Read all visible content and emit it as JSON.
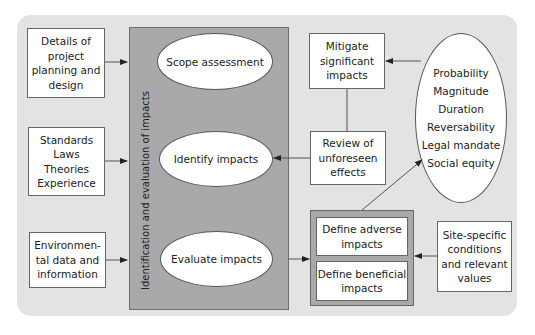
{
  "diagram": {
    "center_panel_label": "Identification and evaluation of impacts",
    "inputs": [
      {
        "id": "project",
        "label": "Details of project planning and design",
        "lines": [
          "Details of",
          "project",
          "planning and",
          "design"
        ]
      },
      {
        "id": "standards",
        "label": "Standards Laws Theories Experience",
        "lines": [
          "Standards",
          "Laws",
          "Theories",
          "Experience"
        ]
      },
      {
        "id": "environmental",
        "label": "Environmental data and information",
        "lines": [
          "Environmen-",
          "tal data and",
          "information"
        ]
      }
    ],
    "steps": [
      {
        "id": "scope",
        "label": "Scope assessment"
      },
      {
        "id": "identify",
        "label": "Identify impacts"
      },
      {
        "id": "evaluate",
        "label": "Evaluate impacts"
      }
    ],
    "mitigate": {
      "lines": [
        "Mitigate",
        "significant",
        "impacts"
      ]
    },
    "review": {
      "lines": [
        "Review of",
        "unforeseen",
        "effects"
      ]
    },
    "define": {
      "adverse": {
        "lines": [
          "Define adverse",
          "impacts"
        ]
      },
      "beneficial": {
        "lines": [
          "Define beneficial",
          "impacts"
        ]
      }
    },
    "site": {
      "lines": [
        "Site-specific",
        "conditions",
        "and relevant",
        "values"
      ]
    },
    "criteria": [
      "Probability",
      "Magnitude",
      "Duration",
      "Reversability",
      "Legal mandate",
      "Social equity"
    ],
    "colors": {
      "panel": "#e3e3e3",
      "center": "#a9a9a9",
      "box": "#ffffff",
      "stroke": "#555555"
    },
    "edges": [
      {
        "from": "project",
        "to": "center_panel"
      },
      {
        "from": "standards",
        "to": "center_panel"
      },
      {
        "from": "environmental",
        "to": "center_panel"
      },
      {
        "from": "evaluate",
        "to": "define"
      },
      {
        "from": "define",
        "to": "criteria"
      },
      {
        "from": "criteria",
        "to": "mitigate"
      },
      {
        "from": "mitigate",
        "to": "review",
        "arrow": false
      },
      {
        "from": "review",
        "to": "identify"
      },
      {
        "from": "site",
        "to": "define"
      }
    ]
  }
}
